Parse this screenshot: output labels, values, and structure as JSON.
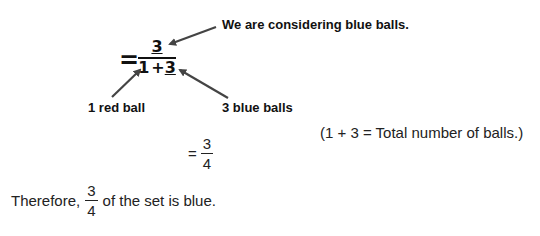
{
  "handwritten": {
    "equals": "=",
    "numerator": "3",
    "denominator_left": "1",
    "denominator_op": "+",
    "denominator_right": "3"
  },
  "annotations": {
    "top": "We are considering blue balls.",
    "bottom_left": "1 red ball",
    "bottom_right": "3 blue balls"
  },
  "note": "(1 + 3 = Total number of balls.)",
  "result": {
    "equals": "=",
    "numerator": "3",
    "denominator": "4"
  },
  "conclusion": {
    "prefix": "Therefore,",
    "numerator": "3",
    "denominator": "4",
    "suffix": "of the set is blue."
  },
  "colors": {
    "ink": "#111111",
    "arrow": "#444444",
    "background": "#ffffff"
  }
}
